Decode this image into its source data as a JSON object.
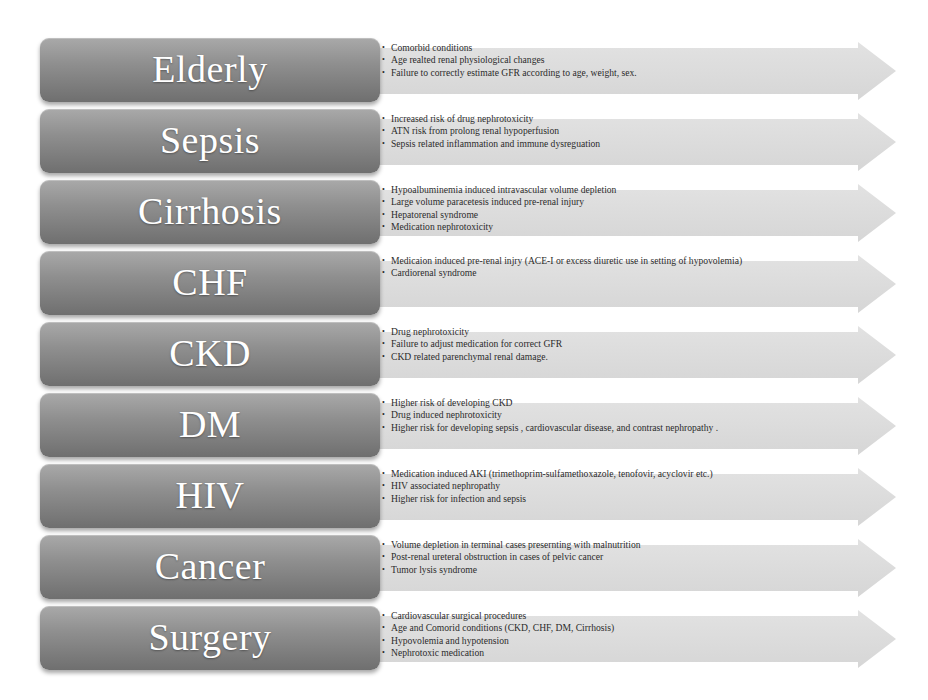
{
  "diagram": {
    "title": "",
    "colors": {
      "box_top": "#a9a9a9",
      "box_bottom": "#6f6f6f",
      "box_text": "#ffffff",
      "arrow_fill": "#dcdcdc",
      "bullet_text": "#2b2b2b",
      "background": "#ffffff"
    },
    "bullet_glyph": "•",
    "rows": [
      {
        "label": "Elderly",
        "bullets": [
          "Comorbid conditions",
          "Age realted renal physiological changes",
          "Failure to correctly estimate GFR according to age, weight, sex."
        ]
      },
      {
        "label": "Sepsis",
        "bullets": [
          "Increased risk of drug nephrotoxicity",
          "ATN risk from prolong renal hypoperfusion",
          "Sepsis related inflammation and immune dysreguation"
        ]
      },
      {
        "label": "Cirrhosis",
        "bullets": [
          "Hypoalbuminemia induced intravascular volume depletion",
          "Large volume paracetesis induced pre-renal injury",
          "Hepatorenal syndrome",
          "Medication nephrotoxicity"
        ]
      },
      {
        "label": "CHF",
        "bullets": [
          "Medicaion induced  pre-renal injry  (ACE-I or excess diuretic use in setting of hypovolemia)",
          "Cardiorenal syndrome"
        ]
      },
      {
        "label": "CKD",
        "bullets": [
          "Drug nephrotoxicity",
          "Failure to adjust medication for correct GFR",
          "CKD related parenchymal renal damage."
        ]
      },
      {
        "label": "DM",
        "bullets": [
          "Higher risk of developing CKD",
          "Drug induced nephrotoxicity",
          "Higher risk for developing sepsis , cardiovascular disease, and contrast nephropathy ."
        ]
      },
      {
        "label": "HIV",
        "bullets": [
          "Medication induced AKI (trimethoprim-sulfamethoxazole, tenofovir, acyclovir  etc.)",
          "HIV associated nephropathy",
          "Higher risk for infection and sepsis"
        ]
      },
      {
        "label": "Cancer",
        "bullets": [
          "Volume depletion in terminal cases presernting with malnutrition",
          "Post-renal ureteral obstruction in cases of pelvic cancer",
          "Tumor lysis syndrome"
        ]
      },
      {
        "label": "Surgery",
        "bullets": [
          "Cardiovascular surgical procedures",
          "Age and Comorid conditions (CKD, CHF, DM, Cirrhosis)",
          "Hypovolemia and hypotension",
          "Nephrotoxic medication"
        ]
      }
    ]
  }
}
